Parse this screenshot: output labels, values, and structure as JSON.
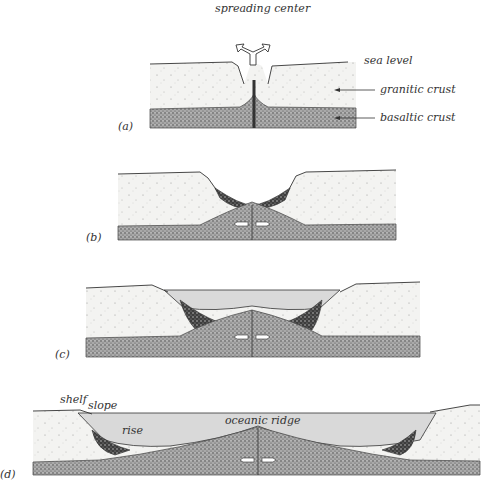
{
  "figure": {
    "panels": [
      {
        "id": "a",
        "label": "(a)"
      },
      {
        "id": "b",
        "label": "(b)"
      },
      {
        "id": "c",
        "label": "(c)"
      },
      {
        "id": "d",
        "label": "(d)"
      }
    ],
    "annotations": {
      "spreading_center": "spreading center",
      "sea_level": "sea level",
      "granitic_crust": "granitic crust",
      "basaltic_crust": "basaltic crust",
      "shelf": "shelf",
      "slope": "slope",
      "rise": "rise",
      "oceanic_ridge": "oceanic ridge"
    },
    "colors": {
      "granitic": "#f1f1ef",
      "basaltic": "#8a8a8a",
      "sediment": "#4a4a4a",
      "water": "#d9d9d9",
      "line": "#333333"
    }
  }
}
